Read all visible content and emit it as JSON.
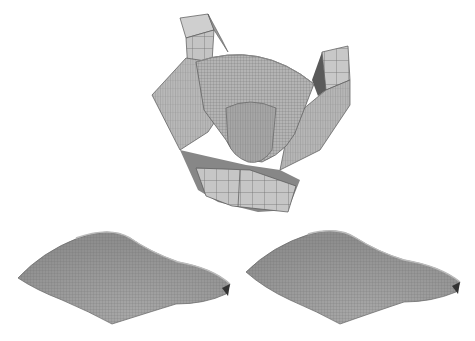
{
  "figure": {
    "panels": [
      {
        "id": "die-assembly",
        "label": ""
      },
      {
        "id": "sheet-left",
        "label": ""
      },
      {
        "id": "sheet-right",
        "label": ""
      }
    ],
    "colors": {
      "background": "#ffffff",
      "mesh_fill_light": "#c4c4c4",
      "mesh_fill_mid": "#a8a8a8",
      "mesh_fill_dark": "#7c7c7c",
      "mesh_line": "#555555"
    }
  }
}
